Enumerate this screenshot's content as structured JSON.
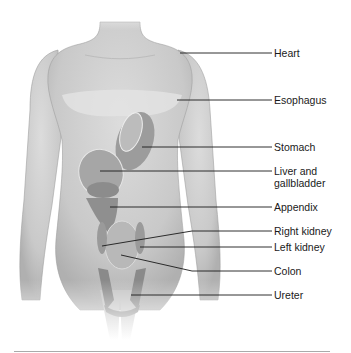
{
  "figure": {
    "type": "anatomical-diagram"
  },
  "labels": [
    {
      "id": "heart",
      "text": "Heart",
      "x": 274,
      "y": 47,
      "line": {
        "x1": 180,
        "y1": 53,
        "x2": 272,
        "y2": 53
      }
    },
    {
      "id": "esophagus",
      "text": "Esophagus",
      "x": 274,
      "y": 94,
      "line": {
        "x1": 177,
        "y1": 100,
        "x2": 272,
        "y2": 100
      }
    },
    {
      "id": "stomach",
      "text": "Stomach",
      "x": 274,
      "y": 141,
      "line": {
        "x1": 142,
        "y1": 147,
        "x2": 272,
        "y2": 147
      }
    },
    {
      "id": "liver",
      "text": "Liver and",
      "text2": "gallbladder",
      "x": 274,
      "y": 165,
      "line": {
        "x1": 100,
        "y1": 171,
        "x2": 272,
        "y2": 171
      }
    },
    {
      "id": "appendix",
      "text": "Appendix",
      "x": 274,
      "y": 201,
      "line": {
        "x1": 110,
        "y1": 207,
        "x2": 272,
        "y2": 207
      }
    },
    {
      "id": "right-kidney",
      "text": "Right kidney",
      "x": 274,
      "y": 225,
      "line": {
        "x1": 102,
        "y1": 246,
        "x2": 192,
        "y2": 231,
        "x3": 272,
        "y3": 231
      }
    },
    {
      "id": "left-kidney",
      "text": "Left kidney",
      "x": 274,
      "y": 242,
      "line": {
        "x1": 140,
        "y1": 247,
        "x2": 272,
        "y2": 247
      }
    },
    {
      "id": "colon",
      "text": "Colon",
      "x": 274,
      "y": 265,
      "line": {
        "x1": 121,
        "y1": 255,
        "x2": 192,
        "y2": 271,
        "x3": 272,
        "y3": 271
      }
    },
    {
      "id": "ureter",
      "text": "Ureter",
      "x": 274,
      "y": 289,
      "line": {
        "x1": 131,
        "y1": 295,
        "x2": 272,
        "y2": 295
      }
    }
  ],
  "colors": {
    "body": "#d4d4d4",
    "body_shadow": "#a8a8a8",
    "organ_light": "#bdbdbd",
    "organ_mid": "#9a9a9a",
    "organ_dark": "#828282",
    "leader_line": "#1a1a1a",
    "text": "#1a1a1a"
  }
}
